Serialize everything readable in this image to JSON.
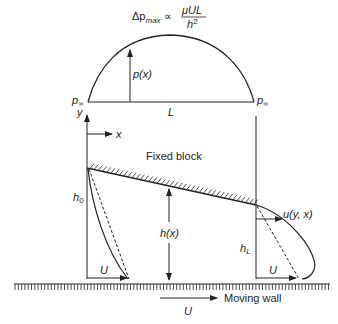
{
  "figure": {
    "colors": {
      "ink": "#222222",
      "background": "#ffffff"
    }
  },
  "pressure": {
    "formula_lhs": "Δp",
    "formula_sub": "max",
    "formula_prop": "∝",
    "formula_num": "μUL",
    "formula_den": "h",
    "formula_den_exp": "2",
    "px_label": "p(x)",
    "pinf_left": "p",
    "pinf_left_sub": "∞",
    "pinf_right": "p",
    "pinf_right_sub": "∞",
    "length_label": "L"
  },
  "axes": {
    "y_label": "y",
    "x_label": "x"
  },
  "block": {
    "label": "Fixed block",
    "h0_label": "h",
    "h0_sub": "0",
    "hx_label": "h(x)",
    "hL_label": "h",
    "hL_sub": "L"
  },
  "profiles": {
    "left_U": "U",
    "right_U": "U",
    "u_label": "u(y, x)"
  },
  "wall": {
    "label": "Moving wall",
    "U_label": "U"
  }
}
